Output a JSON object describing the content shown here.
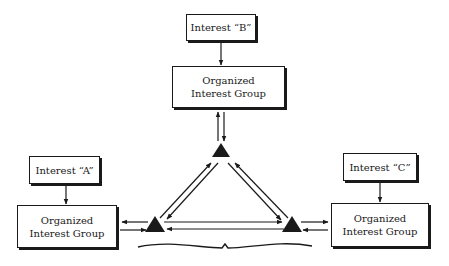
{
  "diagram": {
    "interests": {
      "b": {
        "label": "Interest “B”"
      },
      "a": {
        "label": "Interest “A”"
      },
      "c": {
        "label": "Interest “C”"
      }
    },
    "groups": {
      "top": {
        "line1": "Organized",
        "line2": "Interest Group"
      },
      "left": {
        "line1": "Organized",
        "line2": "Interest Group"
      },
      "right": {
        "line1": "Organized",
        "line2": "Interest Group"
      }
    },
    "colors": {
      "ink": "#1a1a1a",
      "background": "#ffffff"
    }
  }
}
